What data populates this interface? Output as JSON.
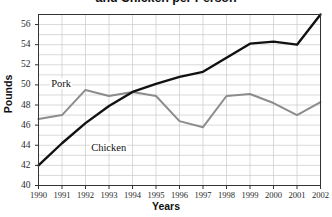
{
  "chart_data": {
    "type": "line",
    "title": "and Chicken per Person",
    "xlabel": "Years",
    "ylabel": "Pounds",
    "categories": [
      "1990",
      "1991",
      "1992",
      "1993",
      "1994",
      "1995",
      "1996",
      "1997",
      "1998",
      "1999",
      "2000",
      "2001",
      "2002"
    ],
    "x_tick_labels": [
      "1990",
      "1991",
      "1992",
      "1993",
      "1994",
      "1995",
      "1996",
      "1997",
      "1998",
      "1999",
      "2000",
      "2001",
      "2002"
    ],
    "y_tick_labels": [
      "40",
      "42",
      "44",
      "46",
      "48",
      "50",
      "52",
      "54",
      "56"
    ],
    "y_ticks": [
      40,
      42,
      44,
      46,
      48,
      50,
      52,
      54,
      56
    ],
    "ylim": [
      40,
      57
    ],
    "xlim": [
      1990,
      2002
    ],
    "grid": true,
    "legend_position": "inline-labels",
    "series": [
      {
        "name": "Pork",
        "color": "#8c8c8c",
        "values": [
          46.6,
          47.0,
          49.5,
          48.9,
          49.3,
          48.9,
          46.4,
          45.8,
          48.9,
          49.1,
          48.2,
          47.0,
          48.3
        ]
      },
      {
        "name": "Chicken",
        "color": "#111111",
        "values": [
          42.0,
          44.2,
          46.2,
          47.9,
          49.3,
          50.1,
          50.8,
          51.3,
          52.7,
          54.1,
          54.3,
          54.0,
          57.0
        ]
      }
    ],
    "annotations": [
      {
        "text": "Pork",
        "x": 1990.5,
        "y": 50.0
      },
      {
        "text": "Chicken",
        "x": 1992.2,
        "y": 43.6
      }
    ]
  }
}
